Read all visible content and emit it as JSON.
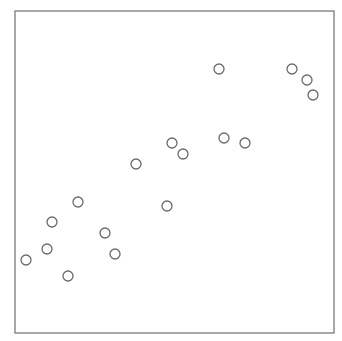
{
  "chart_data": {
    "type": "scatter",
    "title": "",
    "xlabel": "",
    "ylabel": "",
    "grid": false,
    "legend": null,
    "ticks_visible": false,
    "marker": {
      "shape": "open-circle",
      "radius_px": 5,
      "stroke_color": "#6a6a6a"
    },
    "frame_color": "#7a7a7a",
    "plot_area_px": {
      "left": 15,
      "top": 11,
      "right": 334,
      "bottom": 333
    },
    "points_px": [
      {
        "x": 26,
        "y": 260
      },
      {
        "x": 47,
        "y": 249
      },
      {
        "x": 52,
        "y": 222
      },
      {
        "x": 68,
        "y": 276
      },
      {
        "x": 78,
        "y": 202
      },
      {
        "x": 105,
        "y": 233
      },
      {
        "x": 115,
        "y": 254
      },
      {
        "x": 136,
        "y": 164
      },
      {
        "x": 167,
        "y": 206
      },
      {
        "x": 172,
        "y": 143
      },
      {
        "x": 183,
        "y": 154
      },
      {
        "x": 219,
        "y": 69
      },
      {
        "x": 224,
        "y": 138
      },
      {
        "x": 245,
        "y": 143
      },
      {
        "x": 292,
        "y": 69
      },
      {
        "x": 307,
        "y": 80
      },
      {
        "x": 313,
        "y": 95
      }
    ],
    "x": [
      0.03,
      0.1,
      0.12,
      0.17,
      0.2,
      0.28,
      0.31,
      0.38,
      0.47,
      0.49,
      0.52,
      0.64,
      0.65,
      0.72,
      0.87,
      0.92,
      0.93
    ],
    "y": [
      0.23,
      0.26,
      0.35,
      0.18,
      0.41,
      0.31,
      0.25,
      0.52,
      0.39,
      0.59,
      0.56,
      0.82,
      0.6,
      0.59,
      0.82,
      0.78,
      0.74
    ],
    "xlim": [
      0,
      1
    ],
    "ylim": [
      0,
      1
    ]
  }
}
